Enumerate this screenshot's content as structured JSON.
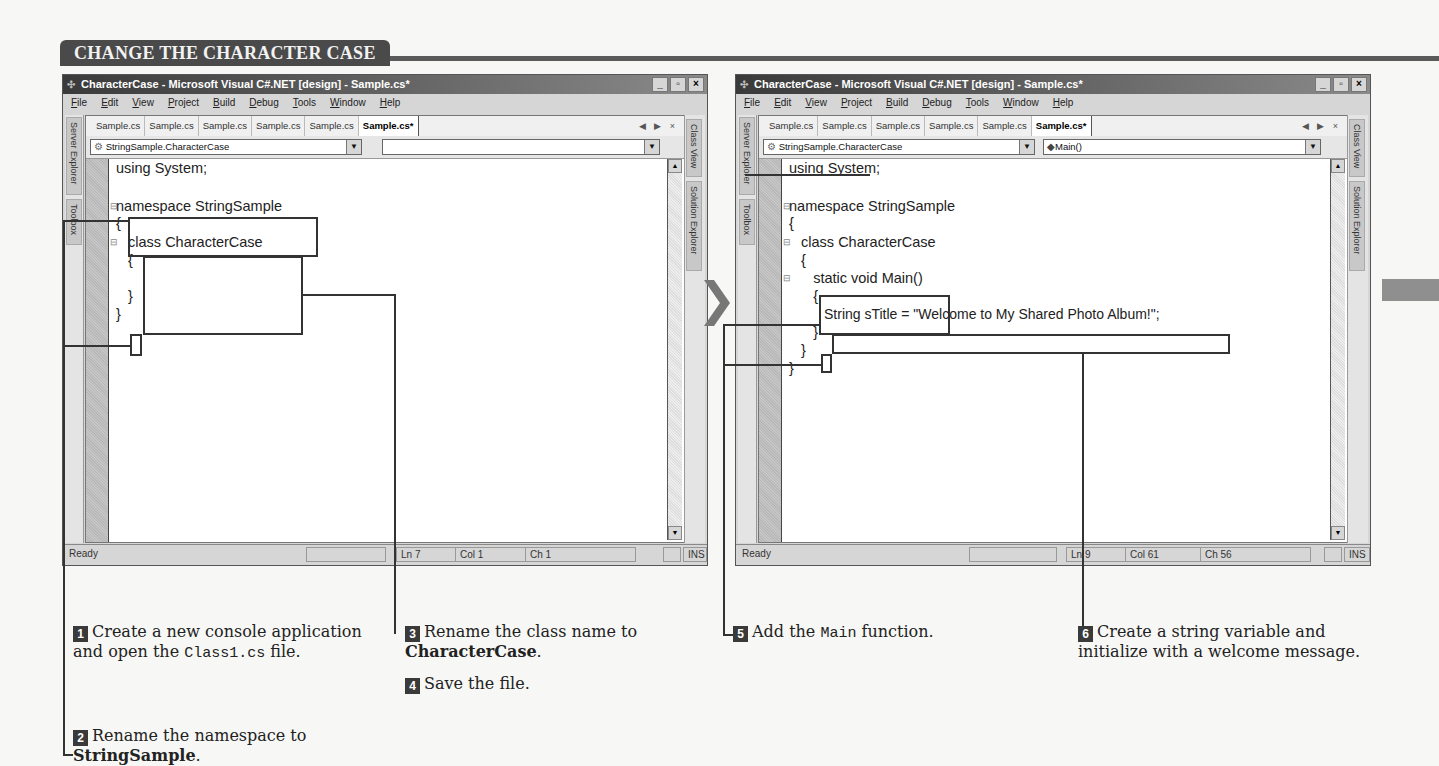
{
  "section": {
    "title": "CHANGE THE CHARACTER CASE"
  },
  "window_left": {
    "title": "CharacterCase - Microsoft Visual C#.NET [design] - Sample.cs*",
    "menu": [
      "File",
      "Edit",
      "View",
      "Project",
      "Build",
      "Debug",
      "Tools",
      "Window",
      "Help"
    ],
    "tabs": [
      "Sample.cs",
      "Sample.cs",
      "Sample.cs",
      "Sample.cs",
      "Sample.cs",
      "Sample.cs*"
    ],
    "active_tab_index": 5,
    "tab_controls": "◀ ▶ ×",
    "left_tool_tabs": [
      "Server Explorer",
      "Toolbox"
    ],
    "right_tool_tabs": [
      "Class View",
      "Solution Explorer"
    ],
    "class_combo": "StringSample.CharacterCase",
    "member_combo": "",
    "code_lines": [
      "using System;",
      "",
      "namespace StringSample",
      "{",
      "   class CharacterCase",
      "   {",
      "",
      "   }",
      "}"
    ],
    "status": {
      "text": "Ready",
      "ln": "Ln 7",
      "col": "Col 1",
      "ch": "Ch 1",
      "mode": "INS"
    },
    "window_buttons": {
      "minimize": "_",
      "restore": "▫",
      "close": "×"
    }
  },
  "window_right": {
    "title": "CharacterCase - Microsoft Visual C#.NET [design] - Sample.cs*",
    "menu": [
      "File",
      "Edit",
      "View",
      "Project",
      "Build",
      "Debug",
      "Tools",
      "Window",
      "Help"
    ],
    "tabs": [
      "Sample.cs",
      "Sample.cs",
      "Sample.cs",
      "Sample.cs",
      "Sample.cs",
      "Sample.cs*"
    ],
    "active_tab_index": 5,
    "tab_controls": "◀ ▶ ×",
    "left_tool_tabs": [
      "Server Explorer",
      "Toolbox"
    ],
    "right_tool_tabs": [
      "Class View",
      "Solution Explorer"
    ],
    "class_combo": "StringSample.CharacterCase",
    "member_combo": "Main()",
    "code_lines": [
      "using System;",
      "",
      "namespace StringSample",
      "{",
      "   class CharacterCase",
      "   {",
      "      static void Main()",
      "      {",
      "         String sTitle = \"Welcome to My Shared Photo Album!\";",
      "      }",
      "   }",
      "}"
    ],
    "status": {
      "text": "Ready",
      "ln": "Ln 9",
      "col": "Col 61",
      "ch": "Ch 56",
      "mode": "INS"
    },
    "window_buttons": {
      "minimize": "_",
      "restore": "▫",
      "close": "×"
    }
  },
  "steps": [
    {
      "num": "1",
      "text_a": "Create a new console application and open the ",
      "code": "Class1.cs",
      "text_b": " file."
    },
    {
      "num": "2",
      "text_a": "Rename the namespace to ",
      "bold": "StringSample",
      "text_b": "."
    },
    {
      "num": "3",
      "text_a": "Rename the class name to ",
      "bold": "CharacterCase",
      "text_b": "."
    },
    {
      "num": "4",
      "text_a": "Save the file."
    },
    {
      "num": "5",
      "text_a": "Add the ",
      "code": "Main",
      "text_b": " function."
    },
    {
      "num": "6",
      "text_a": "Create a string variable and initialize with a welcome message."
    }
  ]
}
